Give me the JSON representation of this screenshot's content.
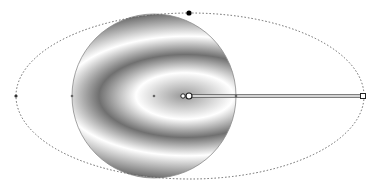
{
  "canvas": {
    "width": 375,
    "height": 192,
    "background": "#ffffff"
  },
  "shape": {
    "type": "circle",
    "cx": 154,
    "cy": 96,
    "r": 82,
    "outline_color": "#8a8a8a"
  },
  "gradient": {
    "type": "radial-elliptical-repeating",
    "center": [
      189,
      96
    ],
    "focus": [
      183,
      96
    ],
    "rx": 174,
    "ry": 83,
    "spread": "repeat",
    "stops": [
      {
        "offset": 0.0,
        "color": "#9a9a9a"
      },
      {
        "offset": 0.28,
        "color": "#ffffff"
      },
      {
        "offset": 0.5,
        "color": "#707070"
      },
      {
        "offset": 0.72,
        "color": "#ffffff"
      },
      {
        "offset": 1.0,
        "color": "#707070"
      }
    ]
  },
  "ellipse_guide": {
    "cx": 190,
    "cy": 96,
    "rx": 174,
    "ry": 83,
    "stroke": "#666666",
    "dash": "1.5 2"
  },
  "handles": {
    "center": {
      "x": 189,
      "y": 96,
      "shape": "circle",
      "fill": "#ffffff"
    },
    "focus": {
      "x": 183,
      "y": 96,
      "shape": "circle",
      "fill": "#ffffff"
    },
    "radius_x_end": {
      "x": 363,
      "y": 96,
      "shape": "square",
      "fill": "#ffffff"
    },
    "radius_y_end": {
      "x": 189,
      "y": 13,
      "shape": "circle",
      "fill": "#000000"
    },
    "left_node": {
      "x": 16,
      "y": 96,
      "shape": "dot"
    },
    "shape_left_node": {
      "x": 72,
      "y": 96,
      "shape": "dot"
    },
    "shape_center_node": {
      "x": 154,
      "y": 96,
      "shape": "dot"
    },
    "shape_right_node": {
      "x": 236,
      "y": 96,
      "shape": "dot"
    }
  },
  "handle_line": {
    "x1": 189,
    "y1": 96,
    "x2": 363,
    "y2": 96,
    "color": "#555555"
  }
}
